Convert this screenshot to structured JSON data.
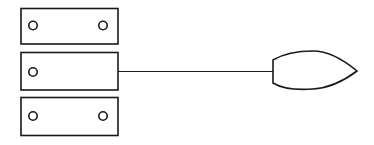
{
  "diagram": {
    "stroke_color": "#1a1a1a",
    "background": "#ffffff",
    "plates": [
      {
        "id": "top-plate",
        "holes": 2
      },
      {
        "id": "middle-plate",
        "holes": 1,
        "connected": true
      },
      {
        "id": "bottom-plate",
        "holes": 2
      }
    ],
    "connector": {
      "type": "line",
      "from": "middle-plate",
      "to": "leaf-shape"
    },
    "end_shape": {
      "type": "pointed-leaf",
      "direction": "right"
    }
  }
}
